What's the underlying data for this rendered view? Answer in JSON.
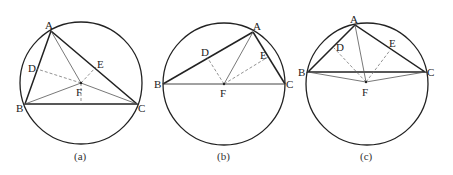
{
  "colors": {
    "stroke": "#222222",
    "thin": "#555555",
    "dashed": "#777777"
  },
  "diagrams": [
    {
      "caption": "(a)",
      "circle": {
        "cx": 81,
        "cy": 83,
        "r": 61
      },
      "points": {
        "A": [
          51,
          31
        ],
        "B": [
          25,
          104
        ],
        "C": [
          137,
          104
        ],
        "D": [
          37,
          69
        ],
        "E": [
          96,
          67
        ],
        "F": [
          81,
          83
        ],
        "M": [
          81,
          104
        ]
      },
      "labels": {
        "A": "A",
        "B": "B",
        "C": "C",
        "D": "D",
        "E": "E",
        "F": "F"
      }
    },
    {
      "caption": "(b)",
      "circle": {
        "cx": 224,
        "cy": 84,
        "r": 61
      },
      "points": {
        "A": [
          253,
          32
        ],
        "B": [
          163,
          84
        ],
        "C": [
          285,
          84
        ],
        "D": [
          207,
          57
        ],
        "E": [
          268,
          57
        ],
        "F": [
          224,
          84
        ]
      },
      "labels": {
        "A": "A",
        "B": "B",
        "C": "C",
        "D": "D",
        "E": "E",
        "F": "F"
      }
    },
    {
      "caption": "(c)",
      "circle": {
        "cx": 367,
        "cy": 84,
        "r": 61
      },
      "points": {
        "A": [
          355,
          25
        ],
        "B": [
          308,
          72
        ],
        "C": [
          425,
          72
        ],
        "D": [
          334,
          48
        ],
        "E": [
          391,
          49
        ],
        "F": [
          366,
          82
        ]
      },
      "labels": {
        "A": "A",
        "B": "B",
        "C": "C",
        "D": "D",
        "E": "E",
        "F": "F"
      }
    }
  ]
}
